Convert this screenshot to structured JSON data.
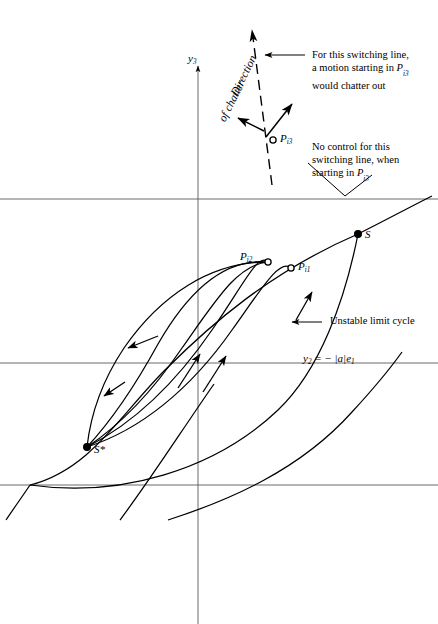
{
  "figure": {
    "type": "phase-plane-diagram",
    "background": "#ffffff",
    "line_color": "#000000",
    "axis_color": "#555555",
    "width": 438,
    "height": 624
  },
  "axes": {
    "vertical_label": "y3",
    "vertical_label_base": "y",
    "vertical_label_sub": "3",
    "horizontal_label_base": "y",
    "horizontal_label_sub": "2",
    "horizontal_label_rest": " =  − |a|e",
    "horizontal_label_rest_sub": "1",
    "horizontal_label_full": "y2 =  − |a|e1"
  },
  "annotations": {
    "direction_of_chatter": {
      "line1": "Direction",
      "line2": "of chatter"
    },
    "switching_chatter": {
      "line1": "For this switching line,",
      "line2_pre": "a motion starting in ",
      "line2_sym": "P",
      "line2_sub": "i3",
      "line3": "would chatter out"
    },
    "no_control": {
      "line1": "No control for this",
      "line2": "switching line, when",
      "line3_pre": "starting in ",
      "line3_sym": "P",
      "line3_sub": "i3"
    },
    "unstable_limit_cycle": "Unstable limit cycle"
  },
  "points": [
    {
      "id": "Pi3",
      "sym": "P",
      "sub": "i3",
      "x": 273,
      "y": 140,
      "label_dx": 7,
      "label_dy": -3
    },
    {
      "id": "Pi2",
      "sym": "P",
      "sub": "i2",
      "x": 268,
      "y": 262,
      "label_dx": -28,
      "label_dy": -8
    },
    {
      "id": "Pi1",
      "sym": "P",
      "sub": "i1",
      "x": 291,
      "y": 268,
      "label_dx": 7,
      "label_dy": -1
    },
    {
      "id": "S",
      "sym": "S",
      "sub": "",
      "x": 358,
      "y": 234,
      "label_dx": 7,
      "label_dy": 2
    },
    {
      "id": "Sstar",
      "sym": "S*",
      "sub": "",
      "x": 87,
      "y": 447,
      "label_dx": 7,
      "label_dy": 5
    }
  ]
}
